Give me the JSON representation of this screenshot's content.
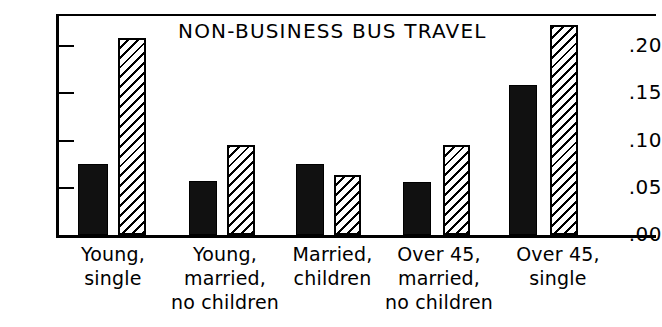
{
  "chart_data": {
    "type": "bar",
    "title": "NON-BUSINESS BUS TRAVEL",
    "xlabel": "",
    "ylabel": "",
    "ylim": [
      0.0,
      0.225
    ],
    "grid": false,
    "legend": "none",
    "ytick_labels": [
      ".20",
      ".15",
      ".10",
      ".05",
      ".00"
    ],
    "ytick_values": [
      0.2,
      0.15,
      0.1,
      0.05,
      0.0
    ],
    "categories": [
      "Young,\nsingle",
      "Young,\nmarried,\nno children",
      "Married,\nchildren",
      "Over 45,\nmarried,\nno children",
      "Over 45,\nsingle"
    ],
    "category_lines": [
      [
        "Young,",
        "single"
      ],
      [
        "Young,",
        "married,",
        "no children"
      ],
      [
        "Married,",
        "children"
      ],
      [
        "Over 45,",
        "married,",
        "no children"
      ],
      [
        "Over 45,",
        "single"
      ]
    ],
    "series": [
      {
        "name": "solid",
        "fill": "solid-black",
        "values": [
          0.072,
          0.055,
          0.072,
          0.054,
          0.153
        ]
      },
      {
        "name": "hatched",
        "fill": "diagonal-hatch",
        "values": [
          0.201,
          0.092,
          0.061,
          0.092,
          0.214
        ]
      }
    ]
  },
  "colors": {
    "axis": "#000000",
    "solid_bar": "#111111",
    "hatch_line": "#000000",
    "background": "#ffffff"
  }
}
